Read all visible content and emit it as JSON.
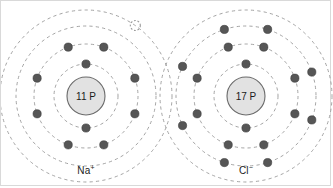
{
  "figure": {
    "type": "bohr-model-ion-diagram",
    "background_color": "#ffffff",
    "border_color": "#d9d9d9",
    "shell_color": "#9a9a9a",
    "electron_color": "#565656",
    "electron_stroke": "#3a3a3a",
    "nucleus_fill": "#e2e2e2",
    "nucleus_stroke": "#6a6a6a",
    "vacancy_color": "#9a9a9a"
  },
  "atoms": [
    {
      "id": "sodium-ion",
      "label": "Na",
      "charge": "+",
      "nucleus_text": "11 P",
      "protons": 11,
      "center": {
        "x": 85,
        "y": 95
      },
      "nucleus_radius": 19,
      "label_position": {
        "x": 85,
        "y": 164
      },
      "shells": [
        {
          "index": 1,
          "radius": 32,
          "electrons": 2,
          "angles": [
            270,
            90
          ]
        },
        {
          "index": 2,
          "radius": 52,
          "electrons": 8,
          "angles": [
            250,
            290,
            200,
            160,
            110,
            70,
            20,
            340
          ]
        },
        {
          "index": 3,
          "radius": 70,
          "electrons": 0,
          "angles": []
        },
        {
          "index": 4,
          "radius": 86,
          "electrons": 0,
          "angles": []
        }
      ],
      "vacancy": {
        "shell": 4,
        "angle": 305,
        "radius": 5,
        "meaning": "lost valence electron"
      }
    },
    {
      "id": "chloride-ion",
      "label": "Cl",
      "charge": "−",
      "nucleus_text": "17 P",
      "protons": 17,
      "center": {
        "x": 245,
        "y": 95
      },
      "nucleus_radius": 19,
      "label_position": {
        "x": 245,
        "y": 164
      },
      "shells": [
        {
          "index": 1,
          "radius": 32,
          "electrons": 2,
          "angles": [
            270,
            90
          ]
        },
        {
          "index": 2,
          "radius": 52,
          "electrons": 8,
          "angles": [
            250,
            290,
            200,
            160,
            110,
            70,
            20,
            340
          ]
        },
        {
          "index": 3,
          "radius": 70,
          "electrons": 8,
          "angles": [
            252,
            288,
            205,
            155,
            108,
            72,
            20,
            340
          ]
        },
        {
          "index": 4,
          "radius": 86,
          "electrons": 0,
          "angles": []
        }
      ],
      "vacancy": null
    }
  ]
}
